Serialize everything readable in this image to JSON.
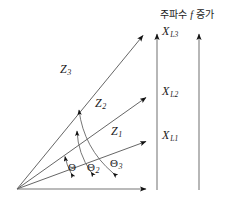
{
  "figure": {
    "header": {
      "prefix": "주파수 ",
      "variable": "f",
      "suffix": " 증가",
      "full_text": "주파수 f 증가"
    },
    "origin_label": "",
    "vectors": [
      {
        "name": "Z1",
        "symbol": "Z",
        "subscript": "1",
        "label_x": 112,
        "label_y": 128,
        "tip_x": 152,
        "tip_y": 140
      },
      {
        "name": "Z2",
        "symbol": "Z",
        "subscript": "2",
        "label_x": 96,
        "label_y": 100,
        "tip_x": 152,
        "tip_y": 95
      },
      {
        "name": "Z3",
        "symbol": "Z",
        "subscript": "3",
        "label_x": 62,
        "label_y": 66,
        "tip_x": 148,
        "tip_y": 32
      }
    ],
    "reactance_labels": [
      {
        "name": "XL1",
        "symbol": "X",
        "subscript": "L1",
        "x": 162,
        "y": 132
      },
      {
        "name": "XL2",
        "symbol": "X",
        "subscript": "L2",
        "x": 162,
        "y": 88
      },
      {
        "name": "XL3",
        "symbol": "X",
        "subscript": "L3",
        "x": 162,
        "y": 28
      }
    ],
    "angle_labels": [
      {
        "name": "theta1",
        "symbol": "Θ",
        "subscript": "",
        "x": 70,
        "y": 163
      },
      {
        "name": "theta2",
        "symbol": "Θ",
        "subscript": "2",
        "x": 89,
        "y": 163
      },
      {
        "name": "theta3",
        "symbol": "Θ",
        "subscript": "3",
        "x": 112,
        "y": 160
      }
    ],
    "axes": {
      "origin": {
        "x": 17,
        "y": 189
      },
      "baseline_tip": {
        "x": 152,
        "y": 189
      },
      "vertical_axis_1_x": 157,
      "vertical_axis_2_x": 199,
      "vertical_axis_top": 30,
      "vertical_axis_bottom": 190
    },
    "colors": {
      "stroke": "#555555",
      "arrowhead": "#111111",
      "text": "#1a1a1a",
      "background": "#ffffff"
    }
  }
}
